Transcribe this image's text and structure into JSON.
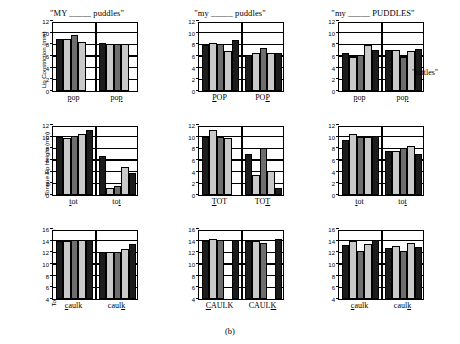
{
  "figure": {
    "caption": "(b)",
    "side_note": "\"tuttles\"",
    "bar_colors": [
      "#1c1c1c",
      "#c9c9c9",
      "#6e6e6e",
      "#c9c9c9",
      "#1c1c1c"
    ],
    "color_classes": [
      "c-black",
      "c-light",
      "c-dark",
      "c-light",
      "c-black"
    ]
  },
  "chart_data": [
    {
      "id": "panel-r0c0",
      "type": "bar",
      "title": "\"MY _____ puddles\"",
      "ylabel": "Lip Constriction (mm)",
      "xlabel": "",
      "ylim": [
        0,
        12
      ],
      "yticks": [
        0,
        2,
        4,
        6,
        8,
        10,
        12
      ],
      "gridlines": [
        2,
        4,
        6,
        8,
        10
      ],
      "grid": true,
      "legend": "none",
      "groups": [
        {
          "label": "pop",
          "underline_index": 0,
          "values": [
            8.9,
            9.0,
            9.6,
            8.4,
            0.0
          ]
        },
        {
          "label": "pop",
          "underline_index": 2,
          "values": [
            8.3,
            8.0,
            8.1,
            8.0,
            0.0
          ]
        }
      ]
    },
    {
      "id": "panel-r0c1",
      "type": "bar",
      "title": "\"my _____ puddles\"",
      "ylabel": "",
      "xlabel": "",
      "ylim": [
        0,
        12
      ],
      "yticks": [
        0,
        2,
        4,
        6,
        8,
        10,
        12
      ],
      "gridlines": [
        2,
        4,
        6,
        8,
        10
      ],
      "grid": true,
      "legend": "none",
      "groups": [
        {
          "label": "POP",
          "underline_index": 0,
          "values": [
            7.9,
            8.3,
            8.0,
            6.8,
            8.8
          ]
        },
        {
          "label": "POP",
          "underline_index": 2,
          "values": [
            6.1,
            6.5,
            7.3,
            6.5,
            6.6
          ]
        }
      ]
    },
    {
      "id": "panel-r0c2",
      "type": "bar",
      "title": "\"my _____ PUDDLES\"",
      "ylabel": "",
      "xlabel": "",
      "ylim": [
        0,
        12
      ],
      "yticks": [
        0,
        2,
        4,
        6,
        8,
        10,
        12
      ],
      "gridlines": [
        2,
        4,
        6,
        8,
        10
      ],
      "grid": true,
      "legend": "none",
      "groups": [
        {
          "label": "pop",
          "underline_index": 0,
          "values": [
            6.5,
            5.9,
            6.2,
            7.9,
            7.1
          ]
        },
        {
          "label": "pop",
          "underline_index": 2,
          "values": [
            7.1,
            7.0,
            5.9,
            6.9,
            7.2
          ]
        }
      ]
    },
    {
      "id": "panel-r1c0",
      "type": "bar",
      "title": "",
      "ylabel": "Tongue Tip Height (mm)",
      "xlabel": "",
      "ylim": [
        0,
        12
      ],
      "yticks": [
        0,
        2,
        4,
        6,
        8,
        10,
        12
      ],
      "gridlines": [
        2,
        4,
        6,
        8,
        10
      ],
      "grid": true,
      "legend": "none",
      "groups": [
        {
          "label": "tot",
          "underline_index": 0,
          "values": [
            9.9,
            9.8,
            10.2,
            10.4,
            11.1
          ]
        },
        {
          "label": "tot",
          "underline_index": 2,
          "values": [
            6.7,
            1.2,
            1.5,
            4.8,
            3.7
          ]
        }
      ]
    },
    {
      "id": "panel-r1c1",
      "type": "bar",
      "title": "",
      "ylabel": "",
      "xlabel": "",
      "ylim": [
        0,
        12
      ],
      "yticks": [
        0,
        2,
        4,
        6,
        8,
        10,
        12
      ],
      "gridlines": [
        2,
        4,
        6,
        8,
        10
      ],
      "grid": true,
      "legend": "none",
      "groups": [
        {
          "label": "TOT",
          "underline_index": 0,
          "values": [
            9.9,
            11.2,
            9.9,
            9.7,
            0.0
          ]
        },
        {
          "label": "TOT",
          "underline_index": 2,
          "values": [
            7.1,
            3.4,
            8.0,
            4.1,
            1.2
          ]
        }
      ]
    },
    {
      "id": "panel-r1c2",
      "type": "bar",
      "title": "",
      "ylabel": "",
      "xlabel": "",
      "ylim": [
        0,
        12
      ],
      "yticks": [
        0,
        2,
        4,
        6,
        8,
        10,
        12
      ],
      "gridlines": [
        2,
        4,
        6,
        8,
        10
      ],
      "grid": true,
      "legend": "none",
      "groups": [
        {
          "label": "tot",
          "underline_index": 0,
          "values": [
            9.5,
            10.4,
            10.0,
            10.0,
            10.2
          ]
        },
        {
          "label": "tot",
          "underline_index": 2,
          "values": [
            7.5,
            7.5,
            8.0,
            8.4,
            7.0
          ]
        }
      ]
    },
    {
      "id": "panel-r2c0",
      "type": "bar",
      "title": "",
      "ylabel": "Tongue Dorsum Height (mm)",
      "xlabel": "",
      "ylim": [
        4,
        16
      ],
      "yticks": [
        4,
        6,
        8,
        10,
        12,
        14,
        16
      ],
      "gridlines": [
        6,
        8,
        10,
        12,
        14
      ],
      "grid": true,
      "legend": "none",
      "groups": [
        {
          "label": "caulk",
          "underline_index": 0,
          "values": [
            14.0,
            14.0,
            14.1,
            14.2,
            14.2
          ]
        },
        {
          "label": "caulk",
          "underline_index": 4,
          "values": [
            12.0,
            12.0,
            12.0,
            12.6,
            13.4
          ]
        }
      ]
    },
    {
      "id": "panel-r2c1",
      "type": "bar",
      "title": "",
      "ylabel": "",
      "xlabel": "",
      "ylim": [
        4,
        16
      ],
      "yticks": [
        4,
        6,
        8,
        10,
        12,
        14,
        16
      ],
      "gridlines": [
        6,
        8,
        10,
        12,
        14
      ],
      "grid": true,
      "legend": "none",
      "groups": [
        {
          "label": "CAULK",
          "underline_index": 0,
          "values": [
            13.9,
            14.3,
            14.2,
            0.0,
            14.2
          ]
        },
        {
          "label": "CAULK",
          "underline_index": 4,
          "values": [
            13.9,
            13.9,
            13.6,
            0.0,
            14.3
          ]
        }
      ]
    },
    {
      "id": "panel-r2c2",
      "type": "bar",
      "title": "",
      "ylabel": "",
      "xlabel": "",
      "ylim": [
        4,
        16
      ],
      "yticks": [
        4,
        6,
        8,
        10,
        12,
        14,
        16
      ],
      "gridlines": [
        6,
        8,
        10,
        12,
        14
      ],
      "grid": true,
      "legend": "none",
      "groups": [
        {
          "label": "caulk",
          "underline_index": 0,
          "values": [
            13.3,
            13.9,
            12.3,
            13.5,
            14.1
          ]
        },
        {
          "label": "caulk",
          "underline_index": 4,
          "values": [
            12.7,
            13.1,
            12.2,
            13.6,
            12.9
          ]
        }
      ]
    }
  ]
}
